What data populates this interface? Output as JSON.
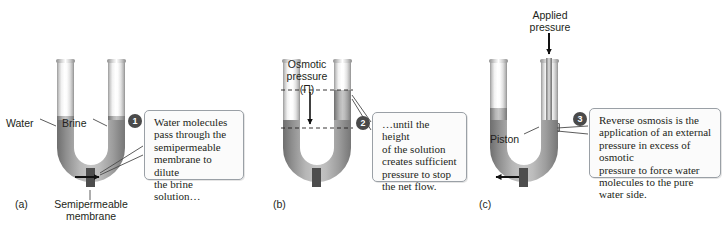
{
  "figure": {
    "panels": [
      {
        "id": "a",
        "label": "(a)",
        "labels": {
          "left_tube": "Water",
          "right_tube": "Brine",
          "membrane": "Semipermeable\nmembrane",
          "membrane_line1": "Semipermeable",
          "membrane_line2": "membrane"
        },
        "flow_direction": "right",
        "callout": {
          "number": "1",
          "text": "Water molecules pass through the semipermeable membrane to dilute the brine solution…",
          "lines": [
            "Water molecules",
            "pass through the",
            "semipermeable",
            "membrane to dilute",
            "the brine solution…"
          ]
        }
      },
      {
        "id": "b",
        "label": "(b)",
        "labels": {
          "pressure_line1": "Osmotic",
          "pressure_line2": "pressure",
          "pressure_symbol": "(Π)"
        },
        "flow_direction": "none",
        "callout": {
          "number": "2",
          "text": "…until the height of the solution creates sufficient pressure to stop the net flow.",
          "lines": [
            "…until the height",
            "of the solution",
            "creates sufficient",
            "pressure to stop",
            "the net flow."
          ]
        }
      },
      {
        "id": "c",
        "label": "(c)",
        "labels": {
          "applied_line1": "Applied",
          "applied_line2": "pressure",
          "piston": "Piston"
        },
        "flow_direction": "left",
        "callout": {
          "number": "3",
          "text": "Reverse osmosis is the application of an external pressure in excess of osmotic pressure to force water molecules to the pure water side.",
          "lines": [
            "Reverse osmosis is the",
            "application of an external",
            "pressure in excess of osmotic",
            "pressure to force water",
            "molecules to the pure water side."
          ]
        }
      }
    ],
    "colors": {
      "liquid": "#9d9d9d",
      "glass_light": "#ffffff",
      "glass_edge": "#8f8f8f",
      "membrane": "#4d4d4d",
      "badge": "#4a4a4a",
      "callout_border": "#9aa0a6",
      "text": "#231f20"
    }
  }
}
